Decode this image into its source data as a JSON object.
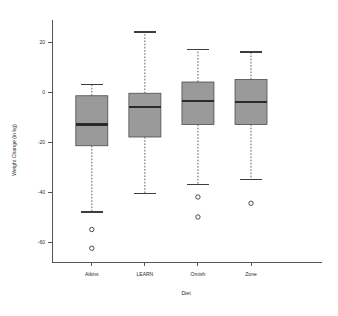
{
  "chart_data": {
    "type": "box",
    "title": "",
    "xlabel": "Diet",
    "ylabel": "Weight Change (in kg)",
    "categories": [
      "Atkins",
      "LEARN",
      "Ornish",
      "Zone"
    ],
    "ylim": [
      -68,
      28
    ],
    "yticks": [
      20,
      0,
      -20,
      -40,
      -60
    ],
    "ytick_labels": [
      "20",
      "0",
      "-20",
      "-40",
      "-60"
    ],
    "grid": false,
    "legend": "none",
    "boxes": [
      {
        "name": "Atkins",
        "whisker_low": -48.0,
        "q1": -21.5,
        "median": -13.0,
        "q3": -1.5,
        "whisker_high": 3.0,
        "outliers": [
          -55.0,
          -62.5
        ]
      },
      {
        "name": "LEARN",
        "whisker_low": -40.5,
        "q1": -18.0,
        "median": -6.0,
        "q3": -0.5,
        "whisker_high": 24.0,
        "outliers": []
      },
      {
        "name": "Ornish",
        "whisker_low": -37.0,
        "q1": -13.0,
        "median": -3.5,
        "q3": 4.0,
        "whisker_high": 17.0,
        "outliers": [
          -42.0,
          -50.0
        ]
      },
      {
        "name": "Zone",
        "whisker_low": -35.0,
        "q1": -13.0,
        "median": -4.0,
        "q3": 5.0,
        "whisker_high": 16.0,
        "outliers": [
          -44.5
        ]
      }
    ],
    "colors": {
      "box_fill": "#9a9a9a",
      "box_stroke": "#4d4d4d",
      "median": "#2a2a2a",
      "axis": "#555555",
      "background": "#ffffff"
    }
  }
}
